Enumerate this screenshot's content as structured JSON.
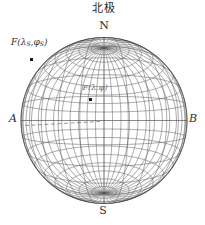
{
  "figure": {
    "title_cn": "北极",
    "north_label": "N",
    "south_label": "S",
    "left_label": "A",
    "right_label": "B"
  },
  "points": {
    "satellite": {
      "label_parts": [
        "F(λ",
        "S",
        ",φ",
        "S",
        ")"
      ],
      "x": 31,
      "y": 59
    },
    "station": {
      "label": "F(λ,φ)",
      "x": 90,
      "y": 99
    }
  },
  "projection": {
    "type": "perspective-globe-wireframe",
    "center_x": 104,
    "center_y": 120.5,
    "radius": 83,
    "view_distance": 2.05,
    "meridian_step_deg": 10,
    "parallel_step_deg": 10,
    "grid_color": "#565656",
    "rim_color": "#3d3d3d",
    "equator_color": "#3d3d3d",
    "dashed_line": {
      "x1": 25,
      "y1": 125.5,
      "x2": 100,
      "y2": 121.5,
      "color": "#6a6a6a"
    }
  }
}
